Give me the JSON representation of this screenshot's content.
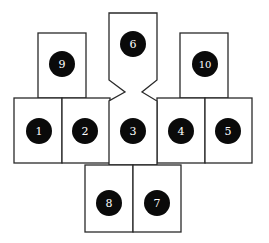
{
  "diagram": {
    "boxes": [
      {
        "id": "1",
        "label": "1"
      },
      {
        "id": "2",
        "label": "2"
      },
      {
        "id": "3",
        "label": "3"
      },
      {
        "id": "4",
        "label": "4"
      },
      {
        "id": "5",
        "label": "5"
      },
      {
        "id": "6",
        "label": "6"
      },
      {
        "id": "7",
        "label": "7"
      },
      {
        "id": "8",
        "label": "8"
      },
      {
        "id": "9",
        "label": "9"
      },
      {
        "id": "10",
        "label": "10"
      }
    ],
    "colors": {
      "outline": "#2a2a2a",
      "marker_fill": "#0a0a0a",
      "marker_text": "#ffffff",
      "background": "#ffffff"
    }
  }
}
